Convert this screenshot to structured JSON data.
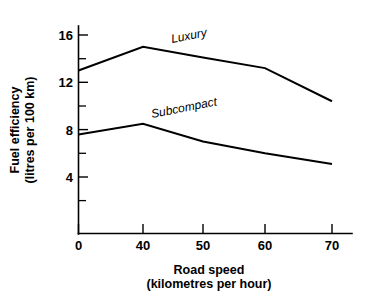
{
  "chart_data": {
    "type": "line",
    "title": "",
    "subtitle": "",
    "xlabel": "Road speed",
    "xlabel_units": "(kilometres per hour)",
    "ylabel": "Fuel efficiency",
    "ylabel_units": "(litres per 100 km)",
    "x": [
      0,
      40,
      50,
      60,
      70
    ],
    "x_tick_labels": [
      "0",
      "40",
      "50",
      "60",
      "70"
    ],
    "x_axis_scale": "categorical-equal-spacing",
    "y_tick_labels": [
      "4",
      "8",
      "12",
      "16"
    ],
    "y_major_ticks": [
      4,
      8,
      12,
      16
    ],
    "y_minor_ticks": [
      2,
      6,
      10,
      14,
      18
    ],
    "ylim": [
      0,
      18
    ],
    "grid": false,
    "legend_position": "inline-on-curve",
    "series": [
      {
        "name": "Luxury",
        "label": "Luxury",
        "color": "#000000",
        "values": [
          13.0,
          15.0,
          14.1,
          13.2,
          10.4
        ]
      },
      {
        "name": "Subcompact",
        "label": "Subcompact",
        "color": "#000000",
        "values": [
          7.6,
          8.5,
          7.0,
          6.0,
          5.1
        ]
      }
    ],
    "annotations": [
      {
        "text": "Luxury",
        "x": 45,
        "y": 15.6,
        "rotation": -11
      },
      {
        "text": "Subcompact",
        "x": 40,
        "y": 10.0,
        "rotation": -11
      }
    ]
  },
  "axes": {
    "y_ticks": [
      {
        "label": "16",
        "value": 16
      },
      {
        "label": "12",
        "value": 12
      },
      {
        "label": "8",
        "value": 8
      },
      {
        "label": "4",
        "value": 4
      }
    ],
    "x_ticks": [
      {
        "label": "0",
        "value": 0
      },
      {
        "label": "40",
        "value": 40
      },
      {
        "label": "50",
        "value": 50
      },
      {
        "label": "60",
        "value": 60
      },
      {
        "label": "70",
        "value": 70
      }
    ]
  },
  "labels": {
    "y_title_line1": "Fuel efficiency",
    "y_title_line2": "(litres per 100 km)",
    "x_title_line1": "Road speed",
    "x_title_line2": "(kilometres per hour)",
    "series_luxury": "Luxury",
    "series_subcompact": "Subcompact"
  },
  "colors": {
    "background": "#ffffff",
    "ink": "#000000",
    "line": "#000000"
  }
}
